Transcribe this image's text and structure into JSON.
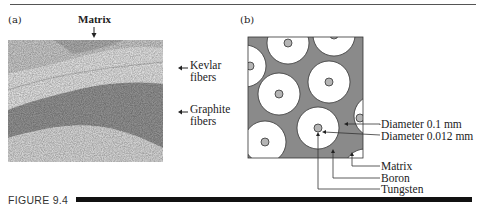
{
  "figure": {
    "caption_label": "FIGURE 9.4",
    "panel_a": {
      "label": "(a)",
      "annotations": {
        "matrix": "Matrix",
        "kevlar_line1": "Kevlar",
        "kevlar_line2": "fibers",
        "graphite_line1": "Graphite",
        "graphite_line2": "fibers"
      },
      "image_description": "micrograph-of-kevlar-graphite-hybrid-composite"
    },
    "panel_b": {
      "label": "(b)",
      "annotations": {
        "diameter_boron": "Diameter 0.1 mm",
        "diameter_tungsten": "Diameter 0.012 mm",
        "matrix": "Matrix",
        "boron": "Boron",
        "tungsten": "Tungsten"
      }
    },
    "colors": {
      "matrix_fill": "#8a8a8a",
      "fiber_fill": "#ffffff",
      "core_fill": "#b5b5b5",
      "rule": "#111111"
    }
  }
}
